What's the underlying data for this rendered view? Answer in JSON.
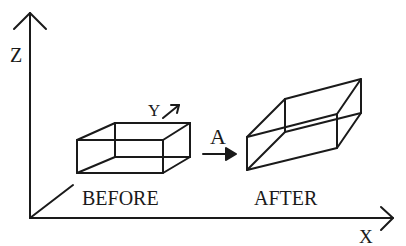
{
  "diagram": {
    "axes": {
      "z_label": "Z",
      "y_label": "Y",
      "x_label": "X"
    },
    "transform_label": "A",
    "before_label": "BEFORE",
    "after_label": "AFTER",
    "colors": {
      "stroke": "#1a1a1a",
      "background": "#ffffff"
    }
  }
}
